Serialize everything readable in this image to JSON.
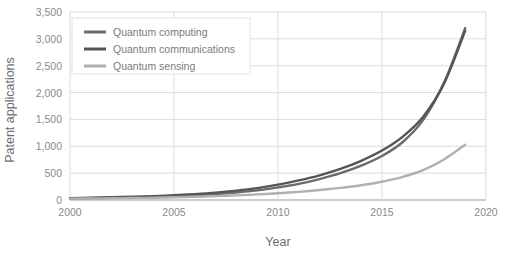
{
  "chart_data": {
    "type": "line",
    "title": "",
    "xlabel": "Year",
    "ylabel": "Patent applications",
    "xlim": [
      2000,
      2020
    ],
    "ylim": [
      0,
      3500
    ],
    "grid": true,
    "legend_position": "top-left",
    "x_ticks": [
      "2000",
      "2005",
      "2010",
      "2015",
      "2020"
    ],
    "x_tick_values": [
      2000,
      2005,
      2010,
      2015,
      2020
    ],
    "y_ticks": [
      "0",
      "500",
      "1,000",
      "1,500",
      "2,000",
      "2,500",
      "3,000",
      "3,500"
    ],
    "y_tick_values": [
      0,
      500,
      1000,
      1500,
      2000,
      2500,
      3000,
      3500
    ],
    "x": [
      2000,
      2001,
      2002,
      2003,
      2004,
      2005,
      2006,
      2007,
      2008,
      2009,
      2010,
      2011,
      2012,
      2013,
      2014,
      2015,
      2016,
      2017,
      2018,
      2019
    ],
    "series": [
      {
        "name": "Quantum computing",
        "color": "#6b6b6b",
        "values": [
          30,
          35,
          40,
          48,
          58,
          70,
          88,
          110,
          140,
          180,
          235,
          300,
          390,
          500,
          640,
          820,
          1080,
          1500,
          2200,
          3200
        ]
      },
      {
        "name": "Quantum communications",
        "color": "#555555",
        "values": [
          35,
          42,
          50,
          60,
          72,
          88,
          110,
          138,
          175,
          222,
          285,
          365,
          460,
          580,
          730,
          920,
          1180,
          1560,
          2180,
          3150
        ]
      },
      {
        "name": "Quantum sensing",
        "color": "#b0b0b0",
        "values": [
          25,
          28,
          32,
          37,
          43,
          50,
          60,
          72,
          86,
          104,
          126,
          152,
          185,
          225,
          275,
          340,
          430,
          560,
          760,
          1030
        ]
      }
    ]
  },
  "axes": {
    "y_label": "Patent applications",
    "x_label": "Year"
  },
  "legend": {
    "items": [
      {
        "label": "Quantum computing"
      },
      {
        "label": "Quantum communications"
      },
      {
        "label": "Quantum sensing"
      }
    ]
  },
  "colors": {
    "grid": "#dcdcdc",
    "axis": "#9a9a9a",
    "text": "#8a8a8a",
    "legend_border": "#e2e2e2",
    "background": "#ffffff"
  }
}
